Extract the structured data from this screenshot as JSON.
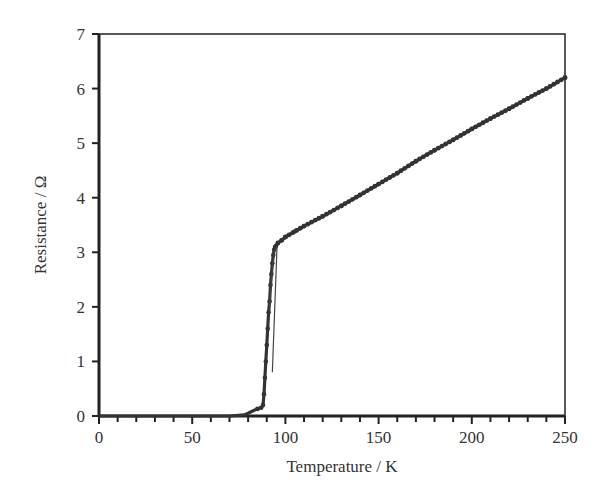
{
  "chart_data": {
    "type": "line",
    "title": "",
    "xlabel": "Temperature / K",
    "ylabel": "Resistance / Ω",
    "xlim": [
      0,
      250
    ],
    "ylim": [
      0,
      7
    ],
    "xticks": [
      0,
      50,
      100,
      150,
      200,
      250
    ],
    "yticks": [
      0,
      1,
      2,
      3,
      4,
      5,
      6,
      7
    ],
    "x_minor_step": 10,
    "grid": false,
    "legend": null,
    "series": [
      {
        "name": "Resistance",
        "marker": "circle",
        "color": "#333333",
        "x": [
          0,
          70,
          78,
          80,
          83,
          85,
          87,
          88,
          88.5,
          89,
          89.5,
          90,
          90.5,
          91,
          91.5,
          92,
          92.5,
          93,
          93.5,
          94,
          94.5,
          95,
          96,
          98,
          100,
          105,
          110,
          120,
          130,
          140,
          150,
          160,
          170,
          180,
          190,
          200,
          210,
          220,
          230,
          240,
          250
        ],
        "y": [
          0,
          0,
          0.02,
          0.05,
          0.1,
          0.13,
          0.15,
          0.2,
          0.4,
          0.7,
          1.0,
          1.3,
          1.6,
          1.9,
          2.1,
          2.4,
          2.6,
          2.8,
          2.95,
          3.05,
          3.1,
          3.12,
          3.17,
          3.22,
          3.28,
          3.38,
          3.48,
          3.66,
          3.85,
          4.05,
          4.25,
          4.45,
          4.67,
          4.87,
          5.06,
          5.26,
          5.45,
          5.63,
          5.82,
          6.0,
          6.2
        ]
      }
    ]
  }
}
